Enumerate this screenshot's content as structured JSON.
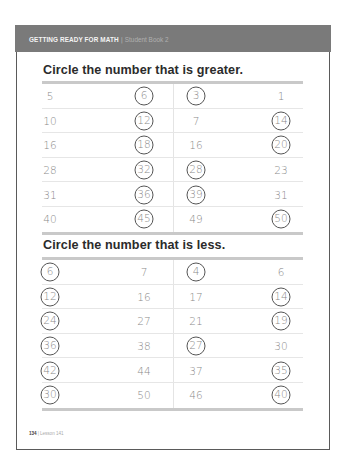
{
  "header": {
    "series": "GETTING READY FOR MATH",
    "separator": "|",
    "book": "Student Book 2"
  },
  "sections": [
    {
      "title": "Circle the number that is greater.",
      "rows": [
        {
          "a": "5",
          "b": "6",
          "c": "3",
          "d": "1"
        },
        {
          "a": "10",
          "b": "12",
          "c": "7",
          "d": "14"
        },
        {
          "a": "16",
          "b": "18",
          "c": "16",
          "d": "20"
        },
        {
          "a": "28",
          "b": "32",
          "c": "28",
          "d": "23"
        },
        {
          "a": "31",
          "b": "36",
          "c": "39",
          "d": "31"
        },
        {
          "a": "40",
          "b": "45",
          "c": "49",
          "d": "50"
        }
      ],
      "circled": [
        [
          "b",
          "c"
        ],
        [
          "b",
          "d"
        ],
        [
          "b",
          "d"
        ],
        [
          "b",
          "c"
        ],
        [
          "b",
          "c"
        ],
        [
          "b",
          "d"
        ]
      ]
    },
    {
      "title": "Circle the number that is less.",
      "rows": [
        {
          "a": "6",
          "b": "7",
          "c": "4",
          "d": "6"
        },
        {
          "a": "12",
          "b": "16",
          "c": "17",
          "d": "14"
        },
        {
          "a": "24",
          "b": "27",
          "c": "21",
          "d": "19"
        },
        {
          "a": "36",
          "b": "38",
          "c": "27",
          "d": "30"
        },
        {
          "a": "42",
          "b": "44",
          "c": "37",
          "d": "35"
        },
        {
          "a": "30",
          "b": "50",
          "c": "46",
          "d": "40"
        }
      ],
      "circled": [
        [
          "a",
          "c"
        ],
        [
          "a",
          "d"
        ],
        [
          "a",
          "d"
        ],
        [
          "a",
          "c"
        ],
        [
          "a",
          "d"
        ],
        [
          "a",
          "d"
        ]
      ]
    }
  ],
  "footer": {
    "page_number": "134",
    "separator": "|",
    "lesson": "Lesson 141"
  },
  "colors": {
    "header_band": "#7a7a7a",
    "rule": "#c9c9c9",
    "number_text": "#8a8a8a",
    "circle_stroke": "#555555",
    "title_text": "#2b2b2b"
  }
}
